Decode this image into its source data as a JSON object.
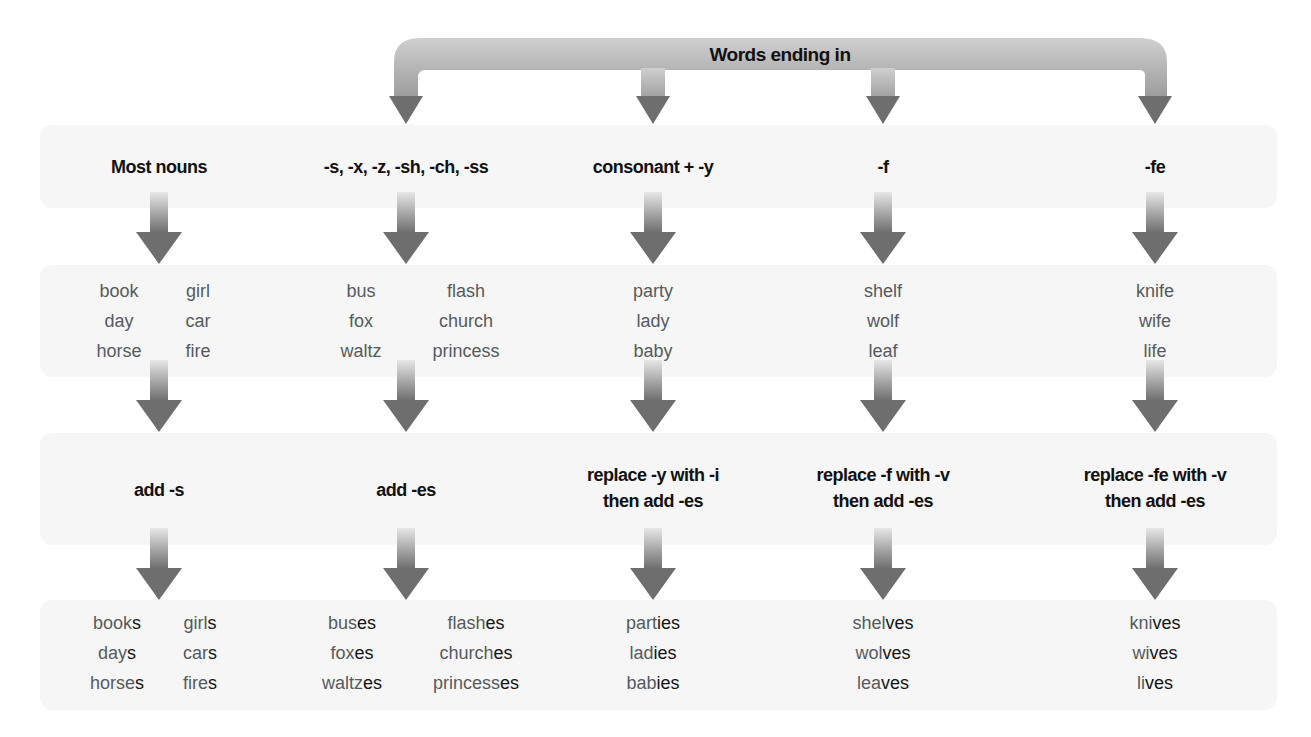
{
  "title": "Words ending in",
  "columns": [
    {
      "id": "most-nouns",
      "header": "Most nouns",
      "examples_left": [
        "book",
        "day",
        "horse"
      ],
      "examples_right": [
        "girl",
        "car",
        "fire"
      ],
      "rule": [
        "add -s"
      ],
      "plurals_left": [
        {
          "stem": "book",
          "suffix": "s"
        },
        {
          "stem": "day",
          "suffix": "s"
        },
        {
          "stem": "horse",
          "suffix": "s"
        }
      ],
      "plurals_right": [
        {
          "stem": "girl",
          "suffix": "s"
        },
        {
          "stem": "car",
          "suffix": "s"
        },
        {
          "stem": "fire",
          "suffix": "s"
        }
      ]
    },
    {
      "id": "sibilant",
      "header": "-s, -x, -z, -sh, -ch, -ss",
      "examples_left": [
        "bus",
        "fox",
        "waltz"
      ],
      "examples_right": [
        "flash",
        "church",
        "princess"
      ],
      "rule": [
        "add -es"
      ],
      "plurals_left": [
        {
          "stem": "bus",
          "suffix": "es"
        },
        {
          "stem": "fox",
          "suffix": "es"
        },
        {
          "stem": "waltz",
          "suffix": "es"
        }
      ],
      "plurals_right": [
        {
          "stem": "flash",
          "suffix": "es"
        },
        {
          "stem": "church",
          "suffix": "es"
        },
        {
          "stem": "princess",
          "suffix": "es"
        }
      ]
    },
    {
      "id": "consonant-y",
      "header": "consonant + -y",
      "examples": [
        "party",
        "lady",
        "baby"
      ],
      "rule": [
        "replace -y with -i",
        "then add -es"
      ],
      "plurals": [
        {
          "stem": "part",
          "suffix": "ies"
        },
        {
          "stem": "lad",
          "suffix": "ies"
        },
        {
          "stem": "bab",
          "suffix": "ies"
        }
      ]
    },
    {
      "id": "f",
      "header": "-f",
      "examples": [
        "shelf",
        "wolf",
        "leaf"
      ],
      "rule": [
        "replace -f with -v",
        "then add -es"
      ],
      "plurals": [
        {
          "stem": "shel",
          "suffix": "ves"
        },
        {
          "stem": "wol",
          "suffix": "ves"
        },
        {
          "stem": "lea",
          "suffix": "ves"
        }
      ]
    },
    {
      "id": "fe",
      "header": "-fe",
      "examples": [
        "knife",
        "wife",
        "life"
      ],
      "rule": [
        "replace -fe with -v",
        "then add -es"
      ],
      "plurals": [
        {
          "stem": "kni",
          "suffix": "ves"
        },
        {
          "stem": "wi",
          "suffix": "ves"
        },
        {
          "stem": "li",
          "suffix": "ves"
        }
      ]
    }
  ],
  "colors": {
    "band": "#f6f6f6",
    "arrow_dark": "#6e6e6e",
    "arrow_light": "#d8d8d8",
    "text_dark": "#111111",
    "text_gray": "#555a60"
  }
}
